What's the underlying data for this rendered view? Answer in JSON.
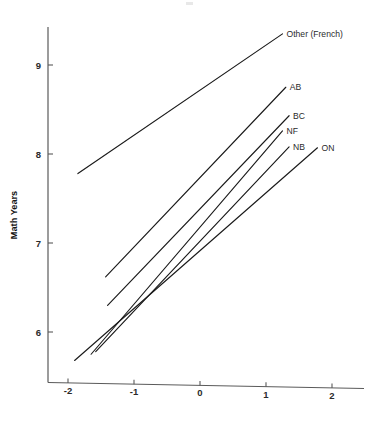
{
  "chart": {
    "type": "line",
    "title": "",
    "subtitle": "",
    "xlabel": "",
    "ylabel": "Math Years",
    "xlim": [
      -2.3,
      2.35
    ],
    "ylim": [
      5.45,
      9.62
    ],
    "xticks": [
      -2,
      -1,
      0,
      1,
      2
    ],
    "xtick_labels": [
      "-2",
      "-1",
      "0",
      "1",
      "2"
    ],
    "yticks": [
      6,
      7,
      8,
      9
    ],
    "ytick_labels": [
      "6",
      "7",
      "8",
      "9"
    ],
    "grid": false,
    "legend": "inline-end-of-line-labels",
    "line_color": "#1a1a1a",
    "axis_color": "#5a5a5a"
  },
  "chart_data": {
    "type": "line",
    "title": "",
    "xlabel": "",
    "ylabel": "Math Years",
    "xlim": [
      -2.3,
      2.35
    ],
    "ylim": [
      5.45,
      9.62
    ],
    "xticks": [
      -2,
      -1,
      0,
      1,
      2
    ],
    "yticks": [
      6,
      7,
      8,
      9
    ],
    "grid": false,
    "series": [
      {
        "name": "Other (French)",
        "label": "Other (French)",
        "x": [
          -1.85,
          1.25
        ],
        "values": [
          7.78,
          9.35
        ]
      },
      {
        "name": "AB",
        "label": "AB",
        "x": [
          -1.43,
          1.3
        ],
        "values": [
          6.62,
          8.75
        ]
      },
      {
        "name": "BC",
        "label": "BC",
        "x": [
          -1.4,
          1.35
        ],
        "values": [
          6.3,
          8.43
        ]
      },
      {
        "name": "NF",
        "label": "NF",
        "x": [
          -1.65,
          1.25
        ],
        "values": [
          5.75,
          8.26
        ]
      },
      {
        "name": "NB",
        "label": "NB",
        "x": [
          -1.58,
          1.35
        ],
        "values": [
          5.78,
          8.08
        ]
      },
      {
        "name": "ON",
        "label": "ON",
        "x": [
          -1.9,
          1.78
        ],
        "values": [
          5.68,
          8.07
        ]
      }
    ]
  }
}
